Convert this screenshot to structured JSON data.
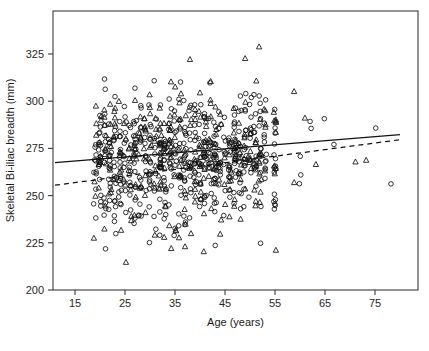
{
  "chart_data": {
    "type": "scatter",
    "title": "",
    "xlabel": "Age (years)",
    "ylabel": "Skeletal Bi-iliac breadth (mm)",
    "xlim": [
      11,
      80
    ],
    "ylim": [
      192,
      335
    ],
    "xticks": [
      15,
      25,
      35,
      45,
      55,
      65,
      75
    ],
    "xtick_labels": [
      "15",
      "25",
      "35",
      "45",
      "55",
      "65",
      "75"
    ],
    "yticks": [
      200,
      225,
      250,
      275,
      300,
      325
    ],
    "ytick_labels": [
      "200",
      "225",
      "250",
      "275",
      "300",
      "325"
    ],
    "grid": false,
    "legend": "none",
    "frame": "box",
    "marker_colors": {
      "stroke": "#111111",
      "fill": "none"
    },
    "series": [
      {
        "name": "circles",
        "marker": "circle",
        "n_points": 520,
        "x_cluster_centers": [
          19,
          20,
          21,
          22,
          23,
          24,
          25,
          26,
          27,
          28,
          29,
          30,
          31,
          32,
          33,
          34,
          35,
          36,
          37,
          38,
          39,
          40,
          41,
          42,
          43,
          44,
          45,
          46,
          47,
          48,
          49,
          50,
          51,
          52,
          53,
          55,
          58,
          60,
          62,
          65,
          67,
          70,
          72,
          75,
          78
        ],
        "y_mean": 268,
        "y_sd": 17
      },
      {
        "name": "triangles",
        "marker": "triangle-up",
        "n_points": 330,
        "x_cluster_centers": [
          19,
          20,
          21,
          22,
          23,
          24,
          25,
          26,
          27,
          28,
          29,
          30,
          31,
          32,
          33,
          34,
          35,
          36,
          37,
          38,
          39,
          40,
          41,
          42,
          43,
          44,
          45,
          46,
          47,
          48,
          49,
          50,
          51,
          52,
          53,
          55,
          57,
          59,
          61,
          63,
          65,
          67,
          69,
          71,
          73,
          76,
          78
        ],
        "y_mean": 272,
        "y_sd": 18
      }
    ],
    "fit_lines": [
      {
        "name": "solid-regression-line",
        "style": "solid",
        "x_start": 11,
        "y_start": 267.5,
        "x_end": 80,
        "y_end": 282.3
      },
      {
        "name": "dashed-regression-line",
        "style": "dashed",
        "x_start": 11,
        "y_start": 255.5,
        "x_end": 80,
        "y_end": 279.6
      }
    ],
    "axes_pixel_geometry": {
      "left": 53,
      "right": 418,
      "top": 11,
      "bottom": 290,
      "x_at_15": 75,
      "x_per_10_years": 50,
      "y_at_200": 290,
      "y_at_325": 54
    }
  }
}
